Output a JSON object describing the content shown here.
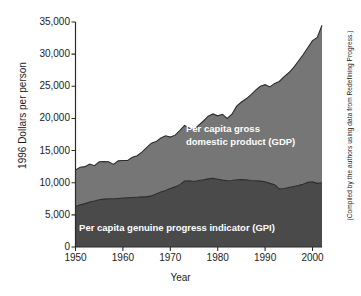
{
  "figure": {
    "xlabel": "Year",
    "ylabel": "1996 Dollars per person",
    "source_note": "(Compiled by the authors using data from Redefining Progress.)"
  },
  "labels": {
    "gdp_line1": "Per capita gross",
    "gdp_line2": "domestic product (GDP)",
    "gpi": "Per capita genuine progress indicator (GPI)"
  },
  "axis": {
    "y_ticks": [
      "0",
      "5,000",
      "10,000",
      "15,000",
      "20,000",
      "25,000",
      "30,000",
      "35,000"
    ],
    "x_ticks": [
      "1950",
      "1960",
      "1970",
      "1980",
      "1990",
      "2000"
    ]
  },
  "colors": {
    "gdp_band": "#767676",
    "gpi_band": "#4a4a4a",
    "outline": "#2b2b2b",
    "axis": "#2b2b2b",
    "background": "#ffffff",
    "label_text": "#ffffff"
  },
  "chart_data": {
    "type": "area",
    "stacked": true,
    "title": "",
    "xlabel": "Year",
    "ylabel": "1996 Dollars per person",
    "xlim": [
      1950,
      2002
    ],
    "ylim": [
      0,
      35000
    ],
    "grid": false,
    "legend": "in-plot area labels",
    "x": [
      1950,
      1951,
      1952,
      1953,
      1954,
      1955,
      1956,
      1957,
      1958,
      1959,
      1960,
      1961,
      1962,
      1963,
      1964,
      1965,
      1966,
      1967,
      1968,
      1969,
      1970,
      1971,
      1972,
      1973,
      1974,
      1975,
      1976,
      1977,
      1978,
      1979,
      1980,
      1981,
      1982,
      1983,
      1984,
      1985,
      1986,
      1987,
      1988,
      1989,
      1990,
      1991,
      1992,
      1993,
      1994,
      1995,
      1996,
      1997,
      1998,
      1999,
      2000,
      2001,
      2002
    ],
    "series": [
      {
        "name": "Per capita genuine progress indicator (GPI)",
        "color": "#4a4a4a",
        "values": [
          6300,
          6550,
          6750,
          7000,
          7150,
          7350,
          7450,
          7500,
          7500,
          7550,
          7600,
          7650,
          7700,
          7750,
          7800,
          7800,
          7950,
          8250,
          8550,
          8800,
          9100,
          9350,
          9700,
          10250,
          10300,
          10200,
          10350,
          10450,
          10600,
          10700,
          10550,
          10400,
          10300,
          10350,
          10450,
          10500,
          10450,
          10350,
          10300,
          10250,
          10150,
          9900,
          9700,
          9050,
          9100,
          9250,
          9400,
          9550,
          9750,
          10050,
          10150,
          9900,
          10000
        ]
      },
      {
        "name": "Per capita gross domestic product (GDP)",
        "color": "#767676",
        "values": [
          12000,
          12400,
          12500,
          12900,
          12650,
          13250,
          13300,
          13250,
          12850,
          13400,
          13450,
          13450,
          13950,
          14200,
          14750,
          15450,
          16150,
          16400,
          16950,
          17300,
          17100,
          17400,
          18100,
          18900,
          18500,
          18250,
          18950,
          19600,
          20350,
          20700,
          20400,
          20650,
          20000,
          20650,
          21900,
          22550,
          23050,
          23650,
          24400,
          25000,
          25250,
          24900,
          25450,
          25750,
          26500,
          27100,
          27900,
          28900,
          29900,
          31000,
          32100,
          32600,
          34500
        ]
      }
    ],
    "notes": {
      "gdp_start_1950": 12000,
      "gdp_end_2002": 34500,
      "gpi_start_1950": 6300,
      "gpi_peak_1978_approx": 10700,
      "gpi_trough_1993_approx": 9050,
      "gpi_end_2002": 10000
    }
  }
}
